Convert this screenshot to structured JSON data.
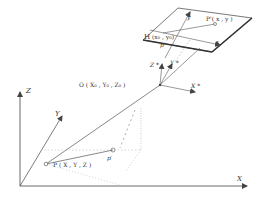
{
  "figure": {
    "type": "collinearity-geometry",
    "colors": {
      "line": "#555555",
      "dash": "#888888",
      "background": "#ffffff"
    }
  },
  "image_plane": {
    "label_H": "H",
    "principal_point": "(x₀ , y₀)",
    "image_point": "P'( x , y )",
    "image_point_alt": "p'",
    "axis_x": "x",
    "axis_y": "y"
  },
  "projection_center": {
    "label": "O ( X₀ , Y₀ , Z₀ )",
    "axis_x": "X *",
    "axis_y": "Y *",
    "axis_z": "Z *"
  },
  "ground": {
    "axis_x": "X",
    "axis_y": "Y",
    "axis_z": "Z",
    "point": "P ( X , Y , Z )",
    "point_alt": "p′"
  }
}
